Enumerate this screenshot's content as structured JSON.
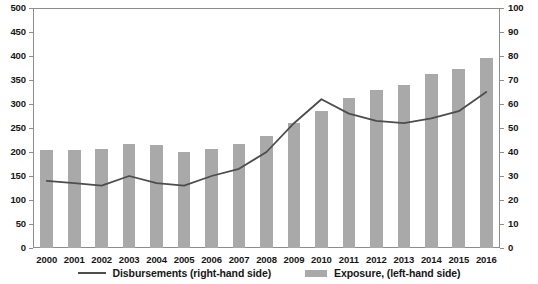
{
  "chart_data": {
    "type": "bar",
    "title": "",
    "xlabel": "",
    "ylabel": "",
    "categories": [
      "2000",
      "2001",
      "2002",
      "2003",
      "2004",
      "2005",
      "2006",
      "2007",
      "2008",
      "2009",
      "2010",
      "2011",
      "2012",
      "2013",
      "2014",
      "2015",
      "2016"
    ],
    "axes": {
      "left": {
        "label": "Exposure, (left-hand side)",
        "min": 0,
        "max": 500,
        "step": 50,
        "ticks": [
          "0",
          "50",
          "100",
          "150",
          "200",
          "250",
          "300",
          "350",
          "400",
          "450",
          "500"
        ]
      },
      "right": {
        "label": "Disbursements (right-hand side)",
        "min": 0,
        "max": 100,
        "step": 10,
        "ticks": [
          "0",
          "10",
          "20",
          "30",
          "40",
          "50",
          "60",
          "70",
          "80",
          "90",
          "100"
        ]
      }
    },
    "grid": false,
    "legend_position": "bottom",
    "series": [
      {
        "name": "Exposure, (left-hand side)",
        "type": "bar",
        "axis": "left",
        "color": "#a9a9a9",
        "values": [
          204,
          205,
          206,
          216,
          215,
          200,
          206,
          216,
          233,
          260,
          285,
          313,
          330,
          340,
          362,
          372,
          396
        ]
      },
      {
        "name": "Disbursements (right-hand side)",
        "type": "line",
        "axis": "right",
        "color": "#4d4d4d",
        "values": [
          28,
          27,
          26,
          30,
          27,
          26,
          30,
          33,
          40,
          52,
          62,
          56,
          53,
          52,
          54,
          57,
          65
        ]
      }
    ]
  },
  "legend": {
    "items": [
      {
        "label": "Disbursements (right-hand side)",
        "marker": "line"
      },
      {
        "label": "Exposure, (left-hand side)",
        "marker": "swatch"
      }
    ]
  }
}
